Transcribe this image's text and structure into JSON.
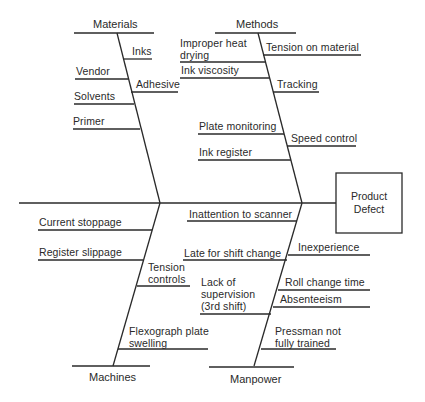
{
  "diagram": {
    "type": "fishbone",
    "effect": "Product Defect",
    "categories": {
      "materials": {
        "label": "Materials",
        "causes": [
          "Inks",
          "Vendor",
          "Adhesive",
          "Solvents",
          "Primer"
        ]
      },
      "methods": {
        "label": "Methods",
        "causes": [
          "Improper heat drying",
          "Tension on material",
          "Ink viscosity",
          "Tracking",
          "Plate monitoring",
          "Speed control",
          "Ink register"
        ]
      },
      "machines": {
        "label": "Machines",
        "causes": [
          "Current stoppage",
          "Register slippage",
          "Tension controls",
          "Flexograph plate swelling"
        ]
      },
      "manpower": {
        "label": "Manpower",
        "causes": [
          "Inattention to scanner",
          "Late for shift change",
          "Inexperience",
          "Lack of supervision (3rd shift)",
          "Roll change time",
          "Absenteeism",
          "Pressman not fully trained"
        ]
      }
    }
  },
  "labels": {
    "effect_line1": "Product",
    "effect_line2": "Defect",
    "improper_heat_line1": "Improper heat",
    "improper_heat_line2": "drying",
    "tension_controls_line1": "Tension",
    "tension_controls_line2": "controls",
    "flexograph_line1": "Flexograph plate",
    "flexograph_line2": "swelling",
    "lack_sup_line1": "Lack of",
    "lack_sup_line2": "supervision",
    "lack_sup_line3": "(3rd shift)",
    "pressman_line1": "Pressman not",
    "pressman_line2": "fully trained"
  }
}
